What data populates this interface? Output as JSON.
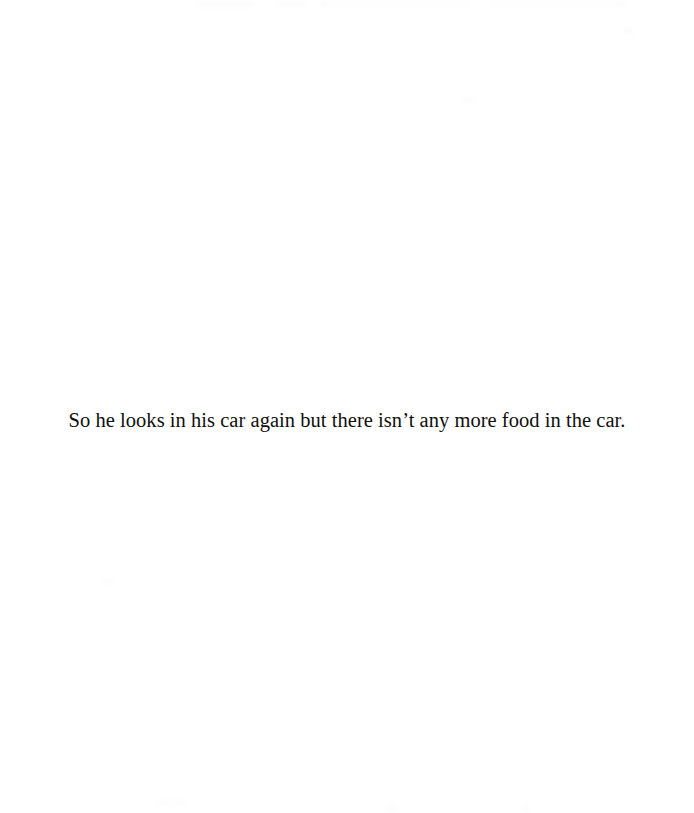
{
  "page": {
    "background_color": "#ffffff",
    "text_color": "#100f0d",
    "width": 694,
    "height": 813
  },
  "content": {
    "body_text": "So he looks in his car again but there isn’t any more food in the car."
  },
  "artifacts": {
    "description": "faint scanner bleed-through marks",
    "color": "#fcfcfd"
  }
}
